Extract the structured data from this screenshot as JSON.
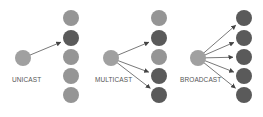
{
  "colors": {
    "source": "#a0a0a0",
    "node_inactive": "#959595",
    "node_active": "#5a5a5a",
    "arrow": "#555555"
  },
  "panels": [
    {
      "label": "UNICAST",
      "source": {
        "x": 23,
        "y": 58
      },
      "label_pos": {
        "x": 12,
        "y": 79
      },
      "column_x": 71,
      "nodes": [
        {
          "y": 18,
          "active": false
        },
        {
          "y": 38,
          "active": true
        },
        {
          "y": 57,
          "active": false
        },
        {
          "y": 76,
          "active": false
        },
        {
          "y": 95,
          "active": false
        }
      ]
    },
    {
      "label": "MULTICAST",
      "source": {
        "x": 111,
        "y": 58
      },
      "label_pos": {
        "x": 96,
        "y": 79
      },
      "column_x": 159,
      "nodes": [
        {
          "y": 18,
          "active": false
        },
        {
          "y": 38,
          "active": true
        },
        {
          "y": 57,
          "active": false
        },
        {
          "y": 76,
          "active": true
        },
        {
          "y": 95,
          "active": true
        }
      ]
    },
    {
      "label": "BROADCAST",
      "source": {
        "x": 198,
        "y": 58
      },
      "label_pos": {
        "x": 181,
        "y": 79
      },
      "column_x": 244,
      "nodes": [
        {
          "y": 18,
          "active": true
        },
        {
          "y": 38,
          "active": true
        },
        {
          "y": 57,
          "active": true
        },
        {
          "y": 76,
          "active": true
        },
        {
          "y": 95,
          "active": true
        }
      ]
    }
  ]
}
